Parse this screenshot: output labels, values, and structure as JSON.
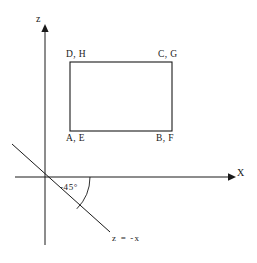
{
  "figure": {
    "background_color": "#ffffff",
    "ink_color": "#1a1a1a",
    "axes": {
      "x_label": "X",
      "z_label": "z",
      "origin": {
        "x": 45,
        "y": 177
      },
      "x_axis": {
        "from_x": 15,
        "to_x": 232,
        "y": 177,
        "arrow": "right"
      },
      "z_axis": {
        "x": 45,
        "from_y": 245,
        "to_y": 28,
        "arrow": "up"
      }
    },
    "rectangle": {
      "left": 70,
      "top": 62,
      "right": 172,
      "bottom": 131,
      "corner_labels": {
        "top_left": "D, H",
        "top_right": "C, G",
        "bottom_left": "A, E",
        "bottom_right": "B, F"
      }
    },
    "diagonal": {
      "equation_label": "z = -x",
      "angle_label": "-45°",
      "angle_degrees": -45,
      "from": {
        "x": 12,
        "y": 144
      },
      "to": {
        "x": 110,
        "y": 232
      },
      "arc_radius": 45
    }
  }
}
